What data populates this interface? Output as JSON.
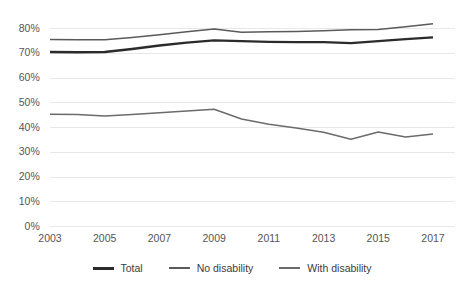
{
  "chart_data": {
    "type": "line",
    "title": "",
    "subtitle": "",
    "xlabel": "",
    "ylabel": "",
    "x": [
      2003,
      2004,
      2005,
      2006,
      2007,
      2008,
      2009,
      2010,
      2011,
      2012,
      2013,
      2014,
      2015,
      2016,
      2017
    ],
    "xlim": [
      2003,
      2017
    ],
    "ylim": [
      0,
      0.85
    ],
    "grid": "horizontal",
    "legend_position": "bottom",
    "y_tick_labels": [
      "0%",
      "10%",
      "20%",
      "30%",
      "40%",
      "50%",
      "60%",
      "70%",
      "80%"
    ],
    "y_tick_values": [
      0,
      10,
      20,
      30,
      40,
      50,
      60,
      70,
      80
    ],
    "x_tick_labels": [
      "2003",
      "2005",
      "2007",
      "2009",
      "2011",
      "2013",
      "2015",
      "2017"
    ],
    "x_tick_values": [
      2003,
      2005,
      2007,
      2009,
      2011,
      2013,
      2015,
      2017
    ],
    "series": [
      {
        "name": "Total",
        "color": "#2b2b2b",
        "width": 2.4,
        "values": [
          70.6,
          70.5,
          70.6,
          71.8,
          73.2,
          74.4,
          75.3,
          75.0,
          74.7,
          74.6,
          74.6,
          74.2,
          75.0,
          75.8,
          76.5
        ]
      },
      {
        "name": "No disability",
        "color": "#5a5a5a",
        "width": 1.5,
        "values": [
          75.6,
          75.5,
          75.5,
          76.5,
          77.6,
          78.8,
          79.9,
          78.6,
          78.8,
          78.9,
          79.2,
          79.6,
          79.7,
          80.8,
          82.0
        ]
      },
      {
        "name": "With disability",
        "color": "#6b6b6b",
        "width": 1.5,
        "values": [
          45.4,
          45.3,
          44.7,
          45.3,
          46.0,
          46.7,
          47.4,
          43.5,
          41.4,
          39.8,
          38.1,
          35.3,
          38.2,
          36.2,
          37.4
        ]
      }
    ]
  },
  "legend": {
    "items": [
      {
        "label": "Total"
      },
      {
        "label": "No disability"
      },
      {
        "label": "With disability"
      }
    ]
  },
  "colors": {
    "background": "#ffffff",
    "gridline": "#e8e8e8",
    "tick_text": "#555555",
    "legend_text": "#3c3c3c"
  }
}
